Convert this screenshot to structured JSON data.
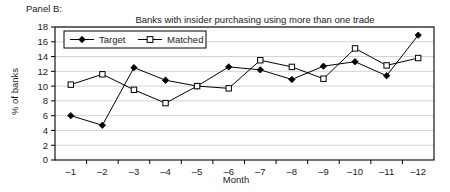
{
  "panel": {
    "label": "Panel B:"
  },
  "chart_data": {
    "type": "line",
    "title": "Banks with insider purchasing using more than one trade",
    "xlabel": "Month",
    "ylabel": "% of banks",
    "categories": [
      "-1",
      "-2",
      "-3",
      "-4",
      "-5",
      "-6",
      "-7",
      "-8",
      "-9",
      "-10",
      "-11",
      "-12"
    ],
    "ylim": [
      0,
      18
    ],
    "ytick_step": 2,
    "yticks": [
      "0",
      "2",
      "4",
      "6",
      "8",
      "10",
      "12",
      "14",
      "16",
      "18"
    ],
    "grid": "horizontal",
    "legend_position": "top-left-inside",
    "series": [
      {
        "name": "Target",
        "marker": "filled-diamond",
        "values": [
          6.0,
          4.7,
          12.5,
          10.8,
          10.0,
          12.6,
          12.2,
          10.9,
          12.7,
          13.3,
          11.4,
          16.9
        ]
      },
      {
        "name": "Matched",
        "marker": "open-square",
        "values": [
          10.2,
          11.6,
          9.5,
          7.7,
          10.0,
          9.7,
          13.5,
          12.6,
          11.0,
          15.1,
          12.8,
          13.8
        ]
      }
    ]
  },
  "colors": {
    "axis": "#000000",
    "grid": "#c8c8c8",
    "series": "#000000",
    "background": "#ffffff"
  }
}
